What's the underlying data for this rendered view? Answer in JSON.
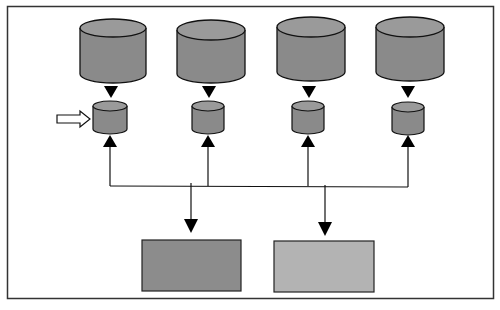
{
  "diagram": {
    "type": "storage-architecture",
    "colors": {
      "frame": "#333333",
      "large_db": "#8a8a8a",
      "large_db_top": "#9a9a9a",
      "small_db": "#8a8a8a",
      "small_db_top": "#9a9a9a",
      "box_dark": "#8c8c8c",
      "box_light": "#b3b3b3",
      "stroke": "#111111"
    },
    "large_databases": [
      {
        "cx": 113
      },
      {
        "cx": 211
      },
      {
        "cx": 311
      },
      {
        "cx": 410
      }
    ],
    "small_databases": [
      {
        "cx": 110,
        "highlighted": true
      },
      {
        "cx": 208
      },
      {
        "cx": 308
      },
      {
        "cx": 408
      }
    ],
    "output_boxes": [
      {
        "label": "",
        "shade": "dark"
      },
      {
        "label": "",
        "shade": "light"
      }
    ],
    "pointer_arrow": {
      "target": "small-database-1"
    }
  }
}
